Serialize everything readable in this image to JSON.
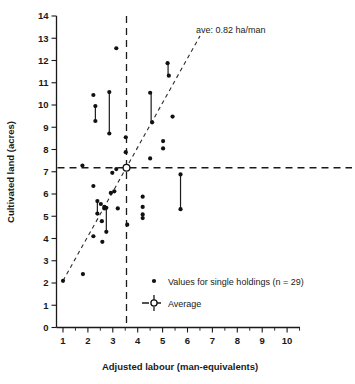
{
  "chart_data": {
    "type": "scatter",
    "title": "",
    "xlabel": "Adjusted labour (man-equivalents)",
    "ylabel": "Cultivated land (acres)",
    "xlim": [
      0.45,
      10.45
    ],
    "ylim": [
      0,
      14
    ],
    "xticks": [
      1,
      2,
      3,
      4,
      5,
      6,
      7,
      8,
      9,
      10
    ],
    "yticks": [
      0,
      1,
      2,
      3,
      4,
      5,
      6,
      7,
      8,
      9,
      10,
      11,
      12,
      13,
      14
    ],
    "grid": false,
    "legend_position": "inside-lower-right",
    "annotation": "ave: 0.82 ha/man",
    "average": {
      "x": 3.55,
      "y": 7.18,
      "label": "Average"
    },
    "trend_line": {
      "x0": 1.0,
      "y0": 2.1,
      "x1": 6.5,
      "y1": 13.1,
      "style": "dashed"
    },
    "points": [
      {
        "x": 1.0,
        "y": 2.1
      },
      {
        "x": 1.8,
        "y": 2.4
      },
      {
        "x": 1.78,
        "y": 7.28
      },
      {
        "x": 2.22,
        "y": 10.45
      },
      {
        "x": 2.3,
        "y": 9.95
      },
      {
        "x": 2.3,
        "y": 9.28
      },
      {
        "x": 2.22,
        "y": 6.36
      },
      {
        "x": 2.22,
        "y": 4.1
      },
      {
        "x": 2.38,
        "y": 5.68
      },
      {
        "x": 2.38,
        "y": 5.12
      },
      {
        "x": 2.52,
        "y": 5.55
      },
      {
        "x": 2.56,
        "y": 4.78
      },
      {
        "x": 2.58,
        "y": 3.85
      },
      {
        "x": 2.66,
        "y": 5.42
      },
      {
        "x": 2.66,
        "y": 5.35
      },
      {
        "x": 2.74,
        "y": 5.38
      },
      {
        "x": 2.74,
        "y": 4.3
      },
      {
        "x": 2.86,
        "y": 10.58
      },
      {
        "x": 2.86,
        "y": 8.72
      },
      {
        "x": 2.92,
        "y": 6.05
      },
      {
        "x": 2.98,
        "y": 6.95
      },
      {
        "x": 3.06,
        "y": 6.12
      },
      {
        "x": 3.14,
        "y": 12.55
      },
      {
        "x": 3.14,
        "y": 7.12
      },
      {
        "x": 3.2,
        "y": 5.35
      },
      {
        "x": 3.52,
        "y": 8.55
      },
      {
        "x": 3.52,
        "y": 7.88
      },
      {
        "x": 3.58,
        "y": 4.62
      },
      {
        "x": 4.2,
        "y": 5.88
      },
      {
        "x": 4.2,
        "y": 5.42
      },
      {
        "x": 4.2,
        "y": 5.08
      },
      {
        "x": 4.2,
        "y": 4.92
      },
      {
        "x": 4.5,
        "y": 10.55
      },
      {
        "x": 4.58,
        "y": 9.22
      },
      {
        "x": 4.5,
        "y": 7.6
      },
      {
        "x": 5.02,
        "y": 8.38
      },
      {
        "x": 5.02,
        "y": 8.05
      },
      {
        "x": 5.2,
        "y": 11.88
      },
      {
        "x": 5.25,
        "y": 11.32
      },
      {
        "x": 5.4,
        "y": 9.48
      },
      {
        "x": 5.72,
        "y": 6.88
      },
      {
        "x": 5.72,
        "y": 5.32
      }
    ],
    "range_bars": [
      {
        "x": 2.3,
        "y_top": 9.95,
        "y_bottom": 9.28
      },
      {
        "x": 2.86,
        "y_top": 10.58,
        "y_bottom": 8.72
      },
      {
        "x": 2.38,
        "y_top": 5.68,
        "y_bottom": 5.12
      },
      {
        "x": 2.74,
        "y_top": 5.38,
        "y_bottom": 4.3
      },
      {
        "x": 4.54,
        "y_top": 10.55,
        "y_bottom": 9.22
      },
      {
        "x": 5.22,
        "y_top": 11.88,
        "y_bottom": 11.32
      },
      {
        "x": 5.72,
        "y_top": 6.88,
        "y_bottom": 5.32
      }
    ],
    "legend": [
      {
        "marker": "dot",
        "label": "Values for single holdings (n = 29)"
      },
      {
        "marker": "open-circle-dashed",
        "label": "Average"
      }
    ]
  },
  "colors": {
    "ink": "#1a1a1a",
    "point": "#111111",
    "background": "#ffffff"
  }
}
